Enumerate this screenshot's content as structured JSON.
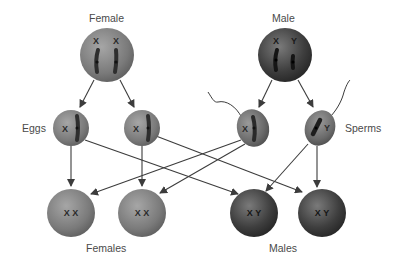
{
  "labels": {
    "female": "Female",
    "male": "Male",
    "eggs": "Eggs",
    "sperms": "Sperms",
    "females": "Females",
    "males": "Males"
  },
  "parents": {
    "female": {
      "chromosomes": [
        "X",
        "X"
      ],
      "color": "#7a7a7a"
    },
    "male": {
      "chromosomes": [
        "X",
        "Y"
      ],
      "color": "#3a3a3a"
    }
  },
  "gametes": {
    "eggs": [
      {
        "chromosome": "X"
      },
      {
        "chromosome": "X"
      }
    ],
    "sperms": [
      {
        "chromosome": "X"
      },
      {
        "chromosome": "Y"
      }
    ]
  },
  "offspring": [
    {
      "genotype": "X X",
      "sex": "female"
    },
    {
      "genotype": "X X",
      "sex": "female"
    },
    {
      "genotype": "X Y",
      "sex": "male"
    },
    {
      "genotype": "X Y",
      "sex": "male"
    }
  ],
  "colors": {
    "female_cell": "#7a7a7a",
    "male_cell": "#3a3a3a",
    "arrow": "#3c3c3c",
    "label_text": "#4a4a4a"
  }
}
